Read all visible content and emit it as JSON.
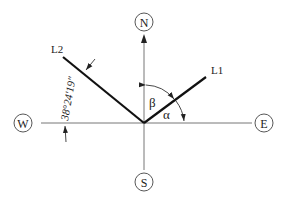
{
  "diagram": {
    "type": "compass-bearing-diagram",
    "directions": {
      "north": "N",
      "south": "S",
      "east": "E",
      "west": "W"
    },
    "lines": {
      "l1": {
        "label": "L1"
      },
      "l2": {
        "label": "L2"
      }
    },
    "angles": {
      "alpha": "α",
      "beta": "β",
      "l2_bearing": "38°24′19″"
    },
    "colors": {
      "axis": "#888888",
      "line": "#111111",
      "text": "#222222"
    }
  }
}
